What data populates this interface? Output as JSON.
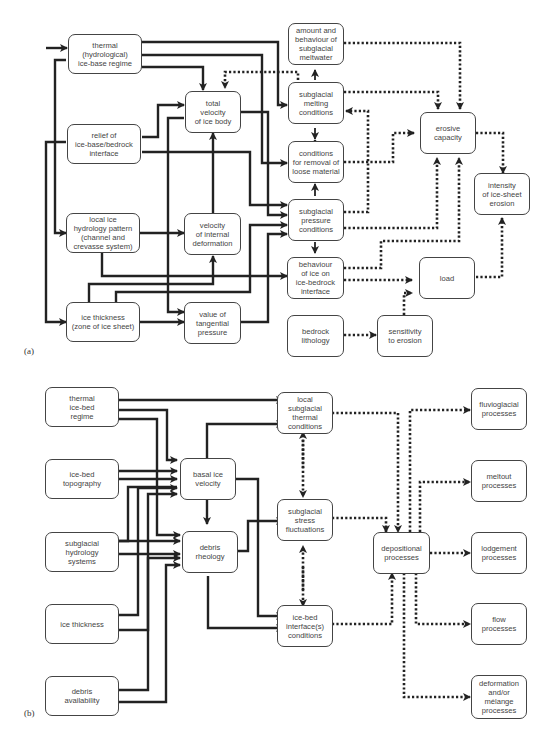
{
  "panel_a": {
    "label": "(a)",
    "boxes": {
      "thermal": "thermal\n(hydrological)\nice-base regime",
      "relief": "relief of\nice-base/bedrock\ninterface",
      "hydrology": "local ice\nhydrology pattern\n(channel and\ncrevasse system)",
      "thickness": "ice thickness\n(zone of ice sheet)",
      "total_velocity": "total\nvelocity\nof ice body",
      "internal_deformation": "velocity\nof internal\ndeformation",
      "tangential": "value of\ntangential\npressure",
      "meltwater": "amount and\nbehaviour of\nsubglacial\nmeltwater",
      "melting": "subglacial\nmelting\nconditions",
      "removal": "conditions\nfor removal of\nloose material",
      "pressure": "subglacial\npressure\nconditions",
      "behaviour": "behaviour\nof ice on\nice-bedrock\ninterface",
      "lithology": "bedrock\nlithology",
      "erosive": "erosive\ncapacity",
      "intensity": "intensity\nof ice-sheet\nerosion",
      "load": "load",
      "sensitivity": "sensitivity\nto erosion"
    }
  },
  "panel_b": {
    "label": "(b)",
    "boxes": {
      "thermal": "thermal\nice-bed\nregime",
      "topography": "ice-bed\ntopography",
      "hydrology": "subglacial\nhydrology\nsystems",
      "thickness": "ice thickness",
      "debris_availability": "debris\navailability",
      "basal_velocity": "basal ice\nvelocity",
      "debris_rheology": "debris\nrheology",
      "local_thermal": "local\nsubglacial\nthermal\nconditions",
      "stress": "subglacial\nstress\nfluctuations",
      "interface": "ice-bed\ninterface(s)\nconditions",
      "depositional": "depositional\nprocesses",
      "fluvioglacial": "fluvioglacial\nprocesses",
      "meltout": "meltout\nprocesses",
      "lodgement": "lodgement\nprocesses",
      "flow": "flow\nprocesses",
      "deformation": "deformation\nand/or\nmélange\nprocesses"
    }
  },
  "legend": {
    "solid_line": "direct (solid) influence",
    "dotted_line": "indirect (dotted) influence"
  }
}
